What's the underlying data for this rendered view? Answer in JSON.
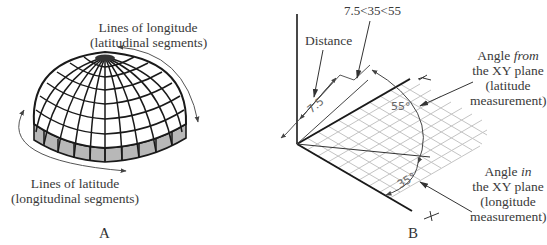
{
  "panel_a": {
    "letter": "A",
    "longitude_label": {
      "line1": "Lines of longitude",
      "line2": "(latitudinal segments)"
    },
    "latitude_label": {
      "line1": "Lines of latitude",
      "line2": "(longitudinal segments)"
    }
  },
  "panel_b": {
    "letter": "B",
    "coordinate_entry": "7.5<35<55",
    "distance_label": "Distance",
    "distance_value": "7.5",
    "angle_from_value": "55°",
    "angle_in_value": "35°",
    "axis_y": "Y",
    "axis_x": "X",
    "angle_from_label": {
      "line1": "Angle ",
      "emph": "from",
      "line2": "the XY plane",
      "line3": "(latitude",
      "line4": "measurement)"
    },
    "angle_in_label": {
      "line1": "Angle ",
      "emph": "in",
      "line2": "the XY plane",
      "line3": "(longitude",
      "line4": "measurement)"
    }
  },
  "colors": {
    "line": "#1a1a1a",
    "band": "#b8b8b8",
    "grid": "#bdbdbd",
    "arrow": "#555555"
  }
}
